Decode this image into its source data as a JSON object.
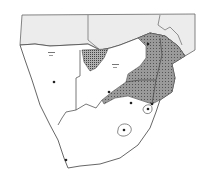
{
  "map": {
    "region": "Southern Africa",
    "colors": {
      "background": "#ffffff",
      "neighbor_fill": "#ececec",
      "land_fill": "#ffffff",
      "border": "#555555",
      "range_fill": "#8a8a8a",
      "hatched_fill": "#9a9a9a",
      "point": "#222222"
    },
    "points": [
      {
        "name": "point-namibia",
        "x": 54,
        "y": 82
      },
      {
        "name": "point-botswana",
        "x": 109,
        "y": 92
      },
      {
        "name": "point-zimbabwe",
        "x": 148,
        "y": 44
      },
      {
        "name": "point-transvaal",
        "x": 131,
        "y": 103
      },
      {
        "name": "point-swaziland",
        "x": 148,
        "y": 109
      },
      {
        "name": "point-lesotho",
        "x": 124,
        "y": 130
      },
      {
        "name": "point-mozambique-south",
        "x": 152,
        "y": 104
      },
      {
        "name": "point-cape",
        "x": 66,
        "y": 160
      }
    ]
  }
}
